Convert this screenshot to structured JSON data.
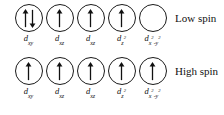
{
  "diagram": {
    "line_color": "#1a1a1a",
    "background": "#ffffff",
    "rows": [
      {
        "id": "low-spin",
        "spin_label": "Low spin",
        "orbitals": [
          {
            "symbol": "d",
            "subscript": "xy",
            "superscript": "",
            "electrons": 2,
            "arrows": "up-down"
          },
          {
            "symbol": "d",
            "subscript": "xz",
            "superscript": "",
            "electrons": 1,
            "arrows": "up"
          },
          {
            "symbol": "d",
            "subscript": "xz",
            "superscript": "",
            "electrons": 1,
            "arrows": "up"
          },
          {
            "symbol": "d",
            "subscript": "z",
            "superscript": "2",
            "electrons": 1,
            "arrows": "up"
          },
          {
            "symbol": "d",
            "subscript": "x",
            "superscript": "2",
            "subscript2": "-y",
            "superscript2": "2",
            "electrons": 0,
            "arrows": "none"
          }
        ]
      },
      {
        "id": "high-spin",
        "spin_label": "High spin",
        "orbitals": [
          {
            "symbol": "d",
            "subscript": "xy",
            "superscript": "",
            "electrons": 1,
            "arrows": "up"
          },
          {
            "symbol": "d",
            "subscript": "xz",
            "superscript": "",
            "electrons": 1,
            "arrows": "up"
          },
          {
            "symbol": "d",
            "subscript": "xz",
            "superscript": "",
            "electrons": 1,
            "arrows": "up"
          },
          {
            "symbol": "d",
            "subscript": "z",
            "superscript": "2",
            "electrons": 1,
            "arrows": "up"
          },
          {
            "symbol": "d",
            "subscript": "x",
            "superscript": "2",
            "subscript2": "-y",
            "superscript2": "2",
            "electrons": 1,
            "arrows": "up"
          }
        ]
      }
    ]
  }
}
